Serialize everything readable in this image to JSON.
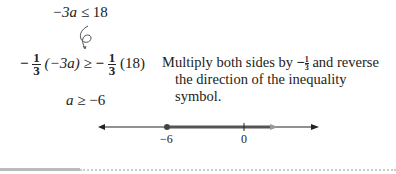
{
  "steps": {
    "line1": {
      "lhs": "−3a",
      "op": "≤",
      "rhs": "18"
    },
    "annotation_symbol": "6",
    "line2": {
      "lhs_coeff_sign": "−",
      "lhs_coeff_num": "1",
      "lhs_coeff_den": "3",
      "lhs_expr": "(−3a)",
      "op": "≥",
      "rhs_coeff_sign": "−",
      "rhs_coeff_num": "1",
      "rhs_coeff_den": "3",
      "rhs_expr": "(18)"
    },
    "line3": {
      "lhs": "a",
      "op": "≥",
      "rhs": "−6"
    }
  },
  "explanation": {
    "line1_before": "Multiply both sides by ",
    "frac_sign": "−",
    "frac_num": "1",
    "frac_den": "3",
    "line1_after": " and reverse",
    "line2": "the direction of the inequality symbol."
  },
  "number_line": {
    "ticks": [
      {
        "value": -6,
        "label": "−6"
      },
      {
        "value": 0,
        "label": "0"
      }
    ],
    "solution": {
      "start": -6,
      "closed": true,
      "direction": "right"
    },
    "colors": {
      "axis": "#222222",
      "shaded": "#555555",
      "arrow_tip": "#999999"
    }
  }
}
